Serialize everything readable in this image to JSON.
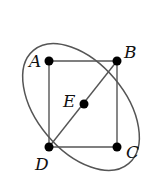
{
  "diagram": {
    "type": "graph",
    "colors": {
      "edge": "#555555",
      "node": "#000000",
      "ellipse": "#555555"
    },
    "nodes": [
      {
        "id": "A",
        "label": "A",
        "x": 49,
        "y": 61
      },
      {
        "id": "B",
        "label": "B",
        "x": 117,
        "y": 61
      },
      {
        "id": "C",
        "label": "C",
        "x": 117,
        "y": 147
      },
      {
        "id": "D",
        "label": "D",
        "x": 49,
        "y": 147
      },
      {
        "id": "E",
        "label": "E",
        "x": 84,
        "y": 104
      }
    ],
    "edges": [
      [
        "A",
        "B"
      ],
      [
        "A",
        "D"
      ],
      [
        "B",
        "C"
      ],
      [
        "D",
        "C"
      ],
      [
        "D",
        "E"
      ],
      [
        "E",
        "B"
      ]
    ],
    "ellipse": {
      "cx": 81,
      "cy": 107,
      "rx": 72,
      "ry": 45,
      "rotation": 50
    }
  }
}
